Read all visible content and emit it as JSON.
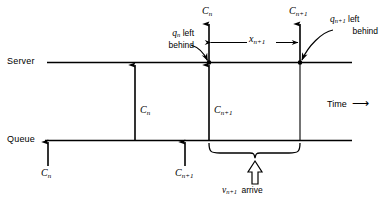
{
  "figure": {
    "kind": "timing-diagram",
    "background_color": "#ffffff",
    "line_color": "#000000"
  },
  "axes": {
    "server_label": "Server",
    "queue_label": "Queue",
    "time_label": "Time",
    "time_arrow_glyph": "⟶"
  },
  "service_completions": {
    "upper_left_label_base": "C",
    "upper_left_label_sub": "n",
    "upper_right_label_base": "C",
    "upper_right_label_sub": "n+1"
  },
  "mid_arrows": {
    "first_base": "C",
    "first_sub": "n",
    "second_base": "C",
    "second_sub": "n+1"
  },
  "queue_arrivals": {
    "first_base": "C",
    "first_sub": "n",
    "second_base": "C",
    "second_sub": "n+1"
  },
  "interval": {
    "label_base": "x",
    "label_sub": "n+1"
  },
  "annotations": {
    "left_behind_n": {
      "symbol_base": "q",
      "symbol_sub": "n",
      "line1_tail": " left",
      "line2": "behind"
    },
    "left_behind_n1": {
      "symbol_base": "q",
      "symbol_sub": "n+1",
      "line1_tail": " left",
      "line2": "behind"
    },
    "arrive": {
      "symbol_base": "v",
      "symbol_sub": "n+1",
      "text": " arrive"
    }
  }
}
